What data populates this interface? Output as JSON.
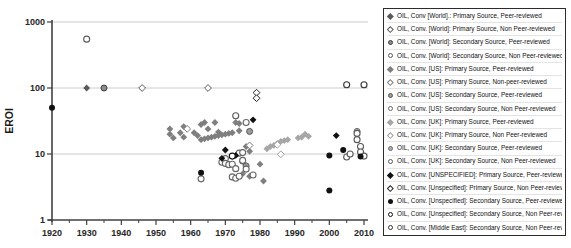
{
  "figure_type": "scatter-chart-with-legend",
  "chart_data": {
    "type": "scatter",
    "title": "",
    "xlabel": "",
    "ylabel": "EROI",
    "x_axis": {
      "min": 1920,
      "max": 2010,
      "major_ticks": [
        1920,
        1930,
        1940,
        1950,
        1960,
        1970,
        1980,
        1990,
        2000,
        2010
      ],
      "minor_tick_interval": 5
    },
    "y_axis": {
      "scale": "log",
      "min": 1,
      "max": 1000,
      "ticks": [
        1000,
        100,
        10,
        1
      ],
      "gridlines_at": [
        10,
        100,
        1000
      ]
    },
    "colors": {
      "world": "#595959",
      "us": "#7f7f7f",
      "uk": "#a6a6a6",
      "unspecified": "#111111",
      "middle_east": "#333333",
      "gridline": "#cccccc",
      "axis": "#404040"
    },
    "series": [
      {
        "name": "OIL, Conv [World].: Primary Source, Peer-reviewed",
        "marker": "diamond-filled",
        "color": "#595959",
        "points": [
          [
            1930,
            100
          ]
        ]
      },
      {
        "name": "OIL, Conv. [World]: Primary Source, Non Peer-reviewed",
        "marker": "diamond-open",
        "color": "#595959",
        "points": [
          [
            1946,
            100
          ],
          [
            1965,
            100
          ]
        ]
      },
      {
        "name": "OIL, Conv. [World]: Secondary Source, Peer-reviewed",
        "marker": "circle-ring",
        "color": "#8c8c8c",
        "ring": "#404040",
        "points": [
          [
            1935,
            100
          ]
        ]
      },
      {
        "name": "OIL, Conv. [World]: Secondary Source, Non Peer-reviewed",
        "marker": "circle-open",
        "color": "#595959",
        "points": [
          [
            1930,
            550
          ],
          [
            1973,
            38
          ]
        ]
      },
      {
        "name": "OIL, Conv. [US]: Primary Source, Peer-reviewed",
        "marker": "diamond-filled",
        "color": "#7f7f7f",
        "points": [
          [
            1954,
            24
          ],
          [
            1954,
            20
          ],
          [
            1955,
            17.5
          ],
          [
            1957,
            21
          ],
          [
            1958,
            26
          ],
          [
            1958,
            18
          ],
          [
            1961,
            21
          ],
          [
            1962,
            19
          ],
          [
            1963,
            28
          ],
          [
            1963,
            16.5
          ],
          [
            1964,
            30
          ],
          [
            1964,
            17
          ],
          [
            1965,
            24
          ],
          [
            1965,
            17.5
          ],
          [
            1966,
            18
          ],
          [
            1967,
            30
          ],
          [
            1967,
            18.5
          ],
          [
            1968,
            21.5
          ],
          [
            1968,
            19
          ],
          [
            1969,
            19.5
          ],
          [
            1970,
            20
          ],
          [
            1971,
            20.5
          ],
          [
            1972,
            21
          ],
          [
            1973,
            30
          ],
          [
            1974,
            29
          ],
          [
            1974,
            22.5
          ],
          [
            1976,
            13
          ],
          [
            1977,
            11
          ],
          [
            1975,
            5
          ],
          [
            1977,
            4.6
          ],
          [
            1980,
            7
          ],
          [
            1981,
            3.9
          ]
        ]
      },
      {
        "name": "OIL, Conv. [US]: Primary Source, Non-peer-reviewed",
        "marker": "diamond-open",
        "color": "#7f7f7f",
        "points": [
          [
            1959,
            24
          ],
          [
            1977,
            13.5
          ]
        ]
      },
      {
        "name": "OIL, Conv. [US]: Secondary Source, Peer-reviewed",
        "marker": "circle-ring",
        "color": "#9c9c9c",
        "ring": "#555555",
        "points": [
          [
            1975,
            7.8
          ],
          [
            1976,
            6.6
          ],
          [
            1977,
            22
          ]
        ]
      },
      {
        "name": "OIL, Conv. [US]: Secondary Source, Non Peer-reviewed",
        "marker": "circle-open",
        "color": "#666666",
        "points": [
          [
            1963,
            4.2
          ],
          [
            1969,
            7.5
          ],
          [
            1970,
            8.5
          ],
          [
            1970,
            7.2
          ],
          [
            1971,
            6.9
          ],
          [
            1972,
            4.5
          ],
          [
            1972,
            7
          ],
          [
            1973,
            4.3
          ],
          [
            1973,
            6
          ],
          [
            1974,
            4.6
          ],
          [
            1974,
            10.3
          ],
          [
            1975,
            10.5
          ],
          [
            1975,
            8
          ],
          [
            1976,
            5.9
          ],
          [
            1976,
            30
          ],
          [
            1978,
            4.8
          ]
        ]
      },
      {
        "name": "OIL, Conv. [UK]: Primary Source, Peer-reviewed",
        "marker": "diamond-filled",
        "color": "#a6a6a6",
        "points": [
          [
            1982,
            12
          ],
          [
            1983,
            13
          ],
          [
            1984,
            13.5
          ],
          [
            1985,
            14.5
          ],
          [
            1986,
            15.5
          ],
          [
            1987,
            16
          ],
          [
            1988,
            16.5
          ],
          [
            1991,
            17.5
          ],
          [
            1992,
            18
          ],
          [
            1993,
            20
          ],
          [
            1994,
            18.5
          ]
        ]
      },
      {
        "name": "OIL, Conv. [UK]: Primary Source, Non Peer-reviewed",
        "marker": "diamond-open",
        "color": "#a0a0a0",
        "points": [
          [
            1985,
            13.8
          ],
          [
            1986,
            9.9
          ]
        ]
      },
      {
        "name": "OIL, Conv. [UK]: Secondary Source, Peer-reviewed",
        "marker": "circle-ring",
        "color": "#b3b3b3",
        "ring": "#666666",
        "points": [
          [
            2008,
            22
          ]
        ]
      },
      {
        "name": "OIL, Conv. [UK]: Secondary Source, Non Peer-reviewed",
        "marker": "circle-open",
        "color": "#595959",
        "points": [
          [
            2005,
            9.0
          ],
          [
            2006,
            10
          ],
          [
            2008,
            20.5
          ],
          [
            2008,
            16.5
          ],
          [
            2009,
            13
          ],
          [
            2009,
            10.7
          ],
          [
            2010,
            9.3
          ]
        ]
      },
      {
        "name": "OIL, Conv. [UNSPECIFIED]: Primary Source, Peer-reviewed",
        "marker": "diamond-filled",
        "color": "#111111",
        "points": [
          [
            1969,
            8.6
          ],
          [
            1970,
            11.5
          ],
          [
            1973,
            9.5
          ],
          [
            1978,
            33
          ],
          [
            2002,
            19
          ]
        ]
      },
      {
        "name": "OIL, Conv. [Unspecified]: Primary Source, Non Peer-reviewed",
        "marker": "diamond-open",
        "color": "#222222",
        "points": [
          [
            1979,
            85
          ],
          [
            1979,
            70
          ]
        ]
      },
      {
        "name": "OIL, Conv. [Unspecified]: Secondary Source, Peer-reviewed",
        "marker": "circle-filled",
        "color": "#111111",
        "points": [
          [
            1920,
            50
          ],
          [
            1963,
            5.2
          ],
          [
            2000,
            2.8
          ],
          [
            2000,
            9.5
          ],
          [
            2004,
            11.5
          ],
          [
            2009,
            9.2
          ]
        ]
      },
      {
        "name": "OIL, Conv. [Unspecified]: Secondary Source, Non Peer-reviewed",
        "marker": "circle-open",
        "color": "#111111",
        "points": [
          [
            1972,
            9.3
          ]
        ]
      },
      {
        "name": "OIL, Conv. [Middle East]: Secondary Source, Non Peer-reviewed",
        "marker": "circle-open",
        "color": "#333333",
        "points": [
          [
            2005,
            112
          ],
          [
            2010,
            112
          ]
        ]
      }
    ]
  },
  "legend": {
    "items": [
      {
        "label": "OIL, Conv [World].: Primary Source, Peer-reviewed",
        "marker": "diamond-filled",
        "color": "#595959"
      },
      {
        "label": "OIL, Conv. [World]: Primary Source, Non Peer-reviewed",
        "marker": "diamond-open",
        "color": "#595959"
      },
      {
        "label": "OIL, Conv. [World]: Secondary Source, Peer-reviewed",
        "marker": "circle-ring",
        "color": "#8c8c8c",
        "ring": "#404040"
      },
      {
        "label": "OIL, Conv. [World]: Secondary Source, Non Peer-reviewed",
        "marker": "circle-open",
        "color": "#595959"
      },
      {
        "label": "OIL, Conv. [US]: Primary Source, Peer-reviewed",
        "marker": "diamond-filled",
        "color": "#7f7f7f"
      },
      {
        "label": "OIL, Conv. [US]: Primary Source, Non-peer-reviewed",
        "marker": "diamond-open",
        "color": "#7f7f7f"
      },
      {
        "label": "OIL, Conv. [US]: Secondary Source, Peer-reviewed",
        "marker": "circle-ring",
        "color": "#9c9c9c",
        "ring": "#555555"
      },
      {
        "label": "OIL, Conv. [US]: Secondary Source, Non Peer-reviewed",
        "marker": "circle-open",
        "color": "#666666"
      },
      {
        "label": "OIL, Conv. [UK]: Primary Source, Peer-reviewed",
        "marker": "diamond-filled",
        "color": "#a6a6a6"
      },
      {
        "label": "OIL, Conv. [UK]: Primary Source, Non Peer-reviewed",
        "marker": "diamond-open",
        "color": "#a0a0a0"
      },
      {
        "label": "OIL, Conv. [UK]: Secondary Source, Peer-reviewed",
        "marker": "circle-ring",
        "color": "#b3b3b3",
        "ring": "#666666"
      },
      {
        "label": "OIL, Conv. [UK]: Secondary Source, Non Peer-reviewed",
        "marker": "circle-open",
        "color": "#595959"
      },
      {
        "label": "OIL, Conv. [UNSPECIFIED]: Primary Source, Peer-reviewed",
        "marker": "diamond-filled",
        "color": "#111111"
      },
      {
        "label": "OIL, Conv. [Unspecified]: Primary Source, Non Peer-reviewed",
        "marker": "diamond-open",
        "color": "#222222"
      },
      {
        "label": "OIL, Conv. [Unspecified]: Secondary Source, Peer-reviewed",
        "marker": "circle-filled",
        "color": "#111111"
      },
      {
        "label": "OIL, Conv. [Unspecified]: Secondary Source, Non Peer-reviewed",
        "marker": "circle-open",
        "color": "#111111"
      },
      {
        "label": "OIL, Conv. [Middle East]: Secondary Source, Non Peer-reviewed",
        "marker": "circle-open",
        "color": "#333333"
      }
    ]
  }
}
